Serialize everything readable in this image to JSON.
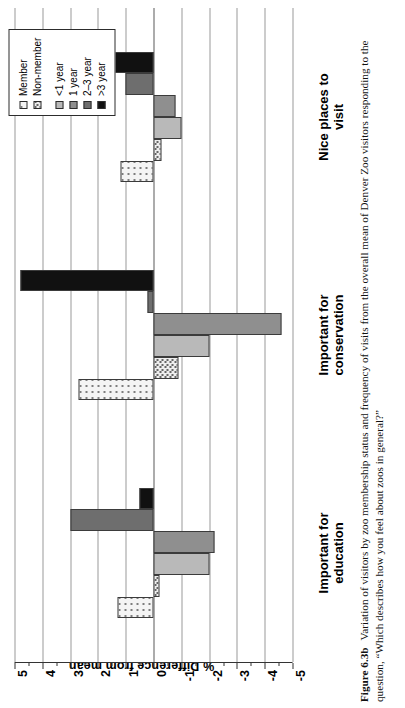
{
  "figure": {
    "caption_label": "Figure 6.3b",
    "caption_text": "Variation of visitors by zoo membership status and frequency of visits from the overall mean of Denver Zoo visitors responding to the question, “Which describes how you feel about zoos in general?”"
  },
  "legend": {
    "items": [
      {
        "label": "Member",
        "swatch": "dotted-light",
        "color": "#f4f4f4"
      },
      {
        "label": "Non-member",
        "swatch": "dotted-dense",
        "color": "#eeeeee"
      },
      {
        "label": "<1 year",
        "swatch": "solid",
        "color": "#b9b9b9"
      },
      {
        "label": "1 year",
        "swatch": "solid",
        "color": "#8f8f8f"
      },
      {
        "label": "2–3 year",
        "swatch": "solid",
        "color": "#6e6e6e"
      },
      {
        "label": ">3 year",
        "swatch": "solid",
        "color": "#111111"
      }
    ]
  },
  "chart_data": {
    "type": "bar",
    "title": "",
    "subtitle": "",
    "orientation": "vertical-grouped",
    "xlabel": "",
    "ylabel": "% Difference from mean",
    "ylim": [
      -5,
      5
    ],
    "ytick_labels": [
      "5",
      "4",
      "3",
      "2",
      "1",
      "0",
      "-1",
      "-2",
      "-3",
      "-4",
      "-5"
    ],
    "yticks": [
      5,
      4,
      3,
      2,
      1,
      0,
      -1,
      -2,
      -3,
      -4,
      -5
    ],
    "minor_ticks": true,
    "grid": true,
    "grid_axis": "y",
    "legend_position": "top-right",
    "categories": [
      "Important for\neducation",
      "Important for\nconservation",
      "Nice places to visit"
    ],
    "category_labels_plain": [
      "Important for education",
      "Important for conservation",
      "Nice places to visit"
    ],
    "series": [
      {
        "name": "Member",
        "color": "#f4f4f4",
        "pattern": "dotted-light",
        "values": [
          1.3,
          2.7,
          1.2
        ]
      },
      {
        "name": "Non-member",
        "color": "#eeeeee",
        "pattern": "dotted-dense",
        "values": [
          -0.2,
          -0.9,
          -0.3
        ]
      },
      {
        "name": "<1 year",
        "color": "#b9b9b9",
        "pattern": "solid",
        "values": [
          -2.0,
          -2.0,
          -1.0
        ]
      },
      {
        "name": "1 year",
        "color": "#8f8f8f",
        "pattern": "solid",
        "values": [
          -2.2,
          -4.6,
          -0.8
        ]
      },
      {
        "name": "2–3 year",
        "color": "#6e6e6e",
        "pattern": "solid",
        "values": [
          3.0,
          0.2,
          1.0
        ]
      },
      {
        "name": ">3 year",
        "color": "#111111",
        "pattern": "solid",
        "values": [
          0.5,
          4.8,
          1.5
        ]
      }
    ]
  }
}
